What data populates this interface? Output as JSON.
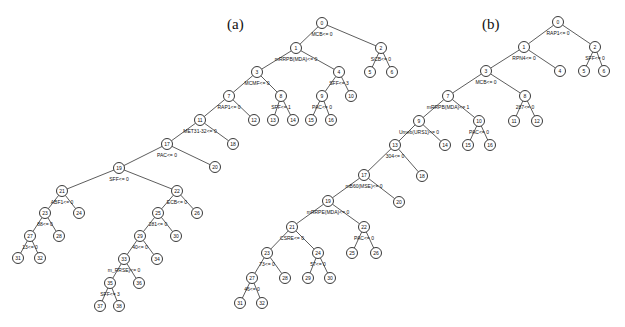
{
  "figure": {
    "panels": [
      {
        "label": "(a)",
        "label_pos": [
          227,
          29
        ],
        "nodes": [
          {
            "id": "0",
            "x": 322,
            "y": 23,
            "split": "MCB<= 0"
          },
          {
            "id": "1",
            "x": 296,
            "y": 48,
            "split": "mRRPB(MDA)<= 0"
          },
          {
            "id": "2",
            "x": 381,
            "y": 48,
            "split": "SCB<= 0"
          },
          {
            "id": "3",
            "x": 257,
            "y": 72,
            "split": "MCMF<= 0"
          },
          {
            "id": "4",
            "x": 339,
            "y": 72,
            "split": "SFF<= 3"
          },
          {
            "id": "5",
            "x": 370,
            "y": 72,
            "split": ""
          },
          {
            "id": "6",
            "x": 392,
            "y": 72,
            "split": ""
          },
          {
            "id": "7",
            "x": 229,
            "y": 96,
            "split": "RAP1<= 0"
          },
          {
            "id": "8",
            "x": 281,
            "y": 96,
            "split": "SFF<= 1"
          },
          {
            "id": "9",
            "x": 322,
            "y": 96,
            "split": "PAC<= 0"
          },
          {
            "id": "10",
            "x": 351,
            "y": 96,
            "split": ""
          },
          {
            "id": "11",
            "x": 200,
            "y": 120,
            "split": "MET31-32<= 0"
          },
          {
            "id": "12",
            "x": 254,
            "y": 120,
            "split": ""
          },
          {
            "id": "13",
            "x": 273,
            "y": 120,
            "split": ""
          },
          {
            "id": "14",
            "x": 293,
            "y": 120,
            "split": ""
          },
          {
            "id": "15",
            "x": 311,
            "y": 120,
            "split": ""
          },
          {
            "id": "16",
            "x": 331,
            "y": 120,
            "split": ""
          },
          {
            "id": "17",
            "x": 167,
            "y": 144,
            "split": "PAC<= 0"
          },
          {
            "id": "18",
            "x": 233,
            "y": 144,
            "split": ""
          },
          {
            "id": "19",
            "x": 119,
            "y": 168,
            "split": "SFF<= 0"
          },
          {
            "id": "20",
            "x": 215,
            "y": 167,
            "split": ""
          },
          {
            "id": "21",
            "x": 62,
            "y": 191,
            "split": "ABF1<= 0"
          },
          {
            "id": "22",
            "x": 177,
            "y": 191,
            "split": "ECB<= 0"
          },
          {
            "id": "23",
            "x": 45,
            "y": 213,
            "split": "88<= 0"
          },
          {
            "id": "24",
            "x": 79,
            "y": 213,
            "split": ""
          },
          {
            "id": "25",
            "x": 158,
            "y": 213,
            "split": "281<= 0"
          },
          {
            "id": "26",
            "x": 197,
            "y": 213,
            "split": ""
          },
          {
            "id": "27",
            "x": 30,
            "y": 236,
            "split": "13<= 0"
          },
          {
            "id": "28",
            "x": 59,
            "y": 236,
            "split": ""
          },
          {
            "id": "29",
            "x": 140,
            "y": 236,
            "split": "40<= 0"
          },
          {
            "id": "30",
            "x": 176,
            "y": 236,
            "split": ""
          },
          {
            "id": "31",
            "x": 18,
            "y": 258,
            "split": ""
          },
          {
            "id": "32",
            "x": 40,
            "y": 258,
            "split": ""
          },
          {
            "id": "33",
            "x": 124,
            "y": 259,
            "split": "m_RRSE)<= 0"
          },
          {
            "id": "34",
            "x": 157,
            "y": 259,
            "split": ""
          },
          {
            "id": "35",
            "x": 110,
            "y": 283,
            "split": "SFF<= 3"
          },
          {
            "id": "36",
            "x": 139,
            "y": 283,
            "split": ""
          },
          {
            "id": "37",
            "x": 100,
            "y": 306,
            "split": ""
          },
          {
            "id": "38",
            "x": 119,
            "y": 306,
            "split": ""
          }
        ],
        "edges": [
          [
            "0",
            "1"
          ],
          [
            "0",
            "2"
          ],
          [
            "1",
            "3"
          ],
          [
            "1",
            "4"
          ],
          [
            "2",
            "5"
          ],
          [
            "2",
            "6"
          ],
          [
            "3",
            "7"
          ],
          [
            "3",
            "8"
          ],
          [
            "4",
            "9"
          ],
          [
            "4",
            "10"
          ],
          [
            "7",
            "11"
          ],
          [
            "7",
            "12"
          ],
          [
            "8",
            "13"
          ],
          [
            "8",
            "14"
          ],
          [
            "9",
            "15"
          ],
          [
            "9",
            "16"
          ],
          [
            "11",
            "17"
          ],
          [
            "11",
            "18"
          ],
          [
            "17",
            "19"
          ],
          [
            "17",
            "20"
          ],
          [
            "19",
            "21"
          ],
          [
            "19",
            "22"
          ],
          [
            "21",
            "23"
          ],
          [
            "21",
            "24"
          ],
          [
            "22",
            "25"
          ],
          [
            "22",
            "26"
          ],
          [
            "23",
            "27"
          ],
          [
            "23",
            "28"
          ],
          [
            "25",
            "29"
          ],
          [
            "25",
            "30"
          ],
          [
            "27",
            "31"
          ],
          [
            "27",
            "32"
          ],
          [
            "29",
            "33"
          ],
          [
            "29",
            "34"
          ],
          [
            "33",
            "35"
          ],
          [
            "33",
            "36"
          ],
          [
            "35",
            "37"
          ],
          [
            "35",
            "38"
          ]
        ]
      },
      {
        "label": "(b)",
        "label_pos": [
          482,
          29
        ],
        "nodes": [
          {
            "id": "0",
            "x": 558,
            "y": 22,
            "split": "RAP1<= 0"
          },
          {
            "id": "1",
            "x": 524,
            "y": 47,
            "split": "RPN4<= 0"
          },
          {
            "id": "2",
            "x": 595,
            "y": 47,
            "split": "SFF<= 0"
          },
          {
            "id": "3",
            "x": 486,
            "y": 71,
            "split": "MCB<= 0"
          },
          {
            "id": "4",
            "x": 560,
            "y": 71,
            "split": ""
          },
          {
            "id": "5",
            "x": 584,
            "y": 71,
            "split": ""
          },
          {
            "id": "6",
            "x": 604,
            "y": 71,
            "split": ""
          },
          {
            "id": "7",
            "x": 448,
            "y": 96,
            "split": "mRRPB(MDA)<= 1"
          },
          {
            "id": "8",
            "x": 525,
            "y": 96,
            "split": "287<= 0"
          },
          {
            "id": "9",
            "x": 419,
            "y": 121,
            "split": "Umeb(URS1)<= 0"
          },
          {
            "id": "10",
            "x": 479,
            "y": 121,
            "split": "PAC<= 0"
          },
          {
            "id": "11",
            "x": 514,
            "y": 121,
            "split": ""
          },
          {
            "id": "12",
            "x": 537,
            "y": 121,
            "split": ""
          },
          {
            "id": "13",
            "x": 395,
            "y": 145,
            "split": "304<= 0"
          },
          {
            "id": "14",
            "x": 445,
            "y": 145,
            "split": ""
          },
          {
            "id": "15",
            "x": 468,
            "y": 145,
            "split": ""
          },
          {
            "id": "16",
            "x": 490,
            "y": 145,
            "split": ""
          },
          {
            "id": "17",
            "x": 364,
            "y": 175,
            "split": "mB60(MSE)<= 0"
          },
          {
            "id": "18",
            "x": 422,
            "y": 176,
            "split": ""
          },
          {
            "id": "19",
            "x": 328,
            "y": 201,
            "split": "mRRPE(MDA)<= 0"
          },
          {
            "id": "20",
            "x": 399,
            "y": 202,
            "split": ""
          },
          {
            "id": "21",
            "x": 292,
            "y": 227,
            "split": "CSRE<= 0"
          },
          {
            "id": "22",
            "x": 364,
            "y": 227,
            "split": "PAC<= 0"
          },
          {
            "id": "23",
            "x": 267,
            "y": 253,
            "split": "73<= 0"
          },
          {
            "id": "24",
            "x": 318,
            "y": 253,
            "split": "57<= 0"
          },
          {
            "id": "25",
            "x": 352,
            "y": 253,
            "split": ""
          },
          {
            "id": "26",
            "x": 376,
            "y": 253,
            "split": ""
          },
          {
            "id": "27",
            "x": 252,
            "y": 278,
            "split": "46<= 0"
          },
          {
            "id": "28",
            "x": 285,
            "y": 278,
            "split": ""
          },
          {
            "id": "29",
            "x": 308,
            "y": 278,
            "split": ""
          },
          {
            "id": "30",
            "x": 330,
            "y": 278,
            "split": ""
          },
          {
            "id": "31",
            "x": 240,
            "y": 303,
            "split": ""
          },
          {
            "id": "32",
            "x": 262,
            "y": 303,
            "split": ""
          }
        ],
        "edges": [
          [
            "0",
            "1"
          ],
          [
            "0",
            "2"
          ],
          [
            "1",
            "3"
          ],
          [
            "1",
            "4"
          ],
          [
            "2",
            "5"
          ],
          [
            "2",
            "6"
          ],
          [
            "3",
            "7"
          ],
          [
            "3",
            "8"
          ],
          [
            "7",
            "9"
          ],
          [
            "7",
            "10"
          ],
          [
            "8",
            "11"
          ],
          [
            "8",
            "12"
          ],
          [
            "9",
            "13"
          ],
          [
            "9",
            "14"
          ],
          [
            "10",
            "15"
          ],
          [
            "10",
            "16"
          ],
          [
            "13",
            "17"
          ],
          [
            "13",
            "18"
          ],
          [
            "17",
            "19"
          ],
          [
            "17",
            "20"
          ],
          [
            "19",
            "21"
          ],
          [
            "19",
            "22"
          ],
          [
            "21",
            "23"
          ],
          [
            "21",
            "24"
          ],
          [
            "22",
            "25"
          ],
          [
            "22",
            "26"
          ],
          [
            "23",
            "27"
          ],
          [
            "23",
            "28"
          ],
          [
            "24",
            "29"
          ],
          [
            "24",
            "30"
          ],
          [
            "27",
            "31"
          ],
          [
            "27",
            "32"
          ]
        ]
      }
    ]
  }
}
